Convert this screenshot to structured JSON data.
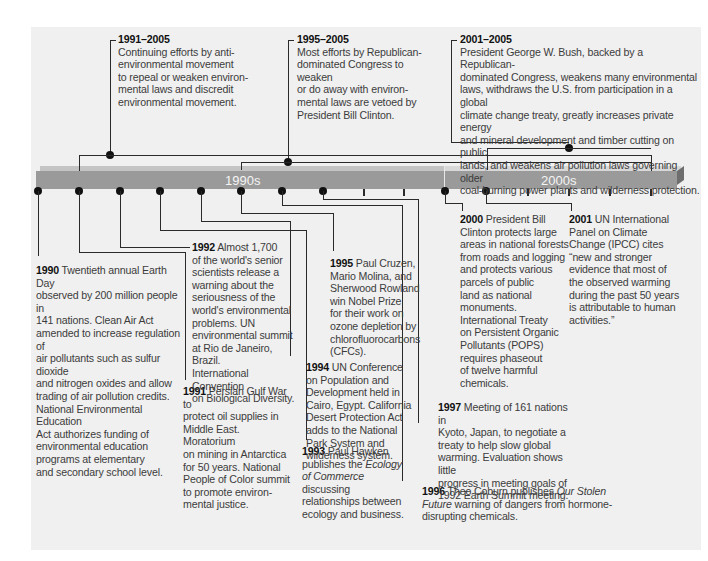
{
  "timeline": {
    "decades": [
      {
        "label": "1990s"
      },
      {
        "label": "2000s"
      }
    ],
    "bar_color": "#9a9a9a",
    "background_color": "#f0f0f0"
  },
  "top_events": [
    {
      "years": "1991–2005",
      "lines": [
        "Continuing efforts by anti-",
        "environmental movement",
        "to repeal or weaken environ-",
        "mental laws and discredit",
        "environmental movement."
      ]
    },
    {
      "years": "1995–2005",
      "lines": [
        "Most efforts by Republican-",
        "dominated Congress to weaken",
        "or do away with environ-",
        "mental laws are vetoed by",
        "President Bill Clinton."
      ]
    },
    {
      "years": "2001–2005",
      "lines": [
        "President George W. Bush, backed by a Republican-",
        "dominated Congress, weakens many environmental",
        "laws, withdraws the U.S. from participation in a global",
        "climate change treaty, greatly increases private energy",
        "and mineral development and timber cutting on public",
        "lands, and weakens air pollution laws governing older",
        "coal-burning power plants and wilderness protection."
      ]
    }
  ],
  "bottom_events": [
    {
      "year": "1990",
      "lines": [
        "Twentieth annual Earth Day",
        "observed by 200 million people in",
        "141 nations. Clean Air Act",
        "amended to increase regulation of",
        "air pollutants such as sulfur dioxide",
        "and nitrogen oxides and allow",
        "trading of air pollution credits.",
        "National Environmental Education",
        "Act authorizes funding of",
        "environmental education",
        "programs at elementary",
        "and secondary school level."
      ]
    },
    {
      "year": "1991",
      "lines": [
        "Persian Gulf War to",
        "protect oil supplies in",
        "Middle East. Moratorium",
        "on mining in Antarctica",
        "for 50 years. National",
        "People of Color summit",
        "to promote environ-",
        "mental justice."
      ]
    },
    {
      "year": "1992",
      "lines": [
        "Almost 1,700",
        "of the world's senior",
        "scientists release a",
        "warning about the",
        "seriousness of the",
        "world's environmental",
        "problems. UN",
        "environmental summit",
        "at Rio de Janeiro, Brazil.",
        "International Convention",
        "on Biological Diversity."
      ]
    },
    {
      "year": "1993",
      "lines_html": [
        "Paul Hawken",
        "publishes the ",
        "Ecology",
        "of Commerce",
        " discussing",
        "relationships between",
        "ecology and business."
      ]
    },
    {
      "year": "1994",
      "lines": [
        "UN Conference",
        "on  Population and",
        "Development held in",
        "Cairo, Egypt. California",
        "Desert Protection Act",
        "adds to the National",
        "Park System and",
        "wilderness system."
      ]
    },
    {
      "year": "1995",
      "lines": [
        "Paul Cruzen,",
        "Mario Molina, and",
        "Sherwood Rowland",
        "win Nobel Prize",
        "for their work on",
        "ozone depletion by",
        "chlorofluorocarbons",
        "(CFCs)."
      ]
    },
    {
      "year": "1996",
      "parts": [
        "Theo Coburn publishes ",
        "Our Stolen",
        "Future",
        " warning of dangers from hormone-",
        "disrupting chemicals."
      ]
    },
    {
      "year": "1997",
      "lines": [
        "Meeting of 161 nations in",
        "Kyoto, Japan, to negotiate a",
        "treaty to help slow global",
        "warming. Evaluation shows little",
        "progress in meeting goals of",
        "1992 Earth Summit meeting."
      ]
    },
    {
      "year": "2000",
      "lines": [
        "President Bill",
        "Clinton protects large",
        "areas in national forests",
        "from roads and logging",
        "and protects various",
        "parcels of public",
        "land as national",
        "monuments.",
        "International Treaty",
        "on Persistent Organic",
        "Pollutants (POPS)",
        "requires phaseout",
        "of twelve harmful",
        "chemicals."
      ]
    },
    {
      "year": "2001",
      "lines": [
        "UN International",
        "Panel on Climate",
        "Change (IPCC) cites",
        "“new and stronger",
        "evidence that most of",
        "the observed warming",
        "during the past 50 years",
        "is attributable to human",
        "activities.”"
      ]
    }
  ]
}
